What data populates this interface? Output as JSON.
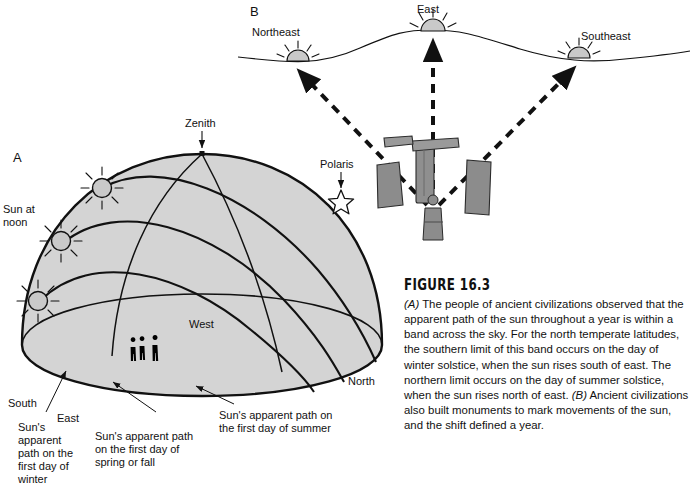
{
  "figure": {
    "number_label": "FIGURE 16.3",
    "caption_parts": {
      "a_marker": "(A)",
      "a_text": " The people of ancient civilizations observed that the apparent path of the sun throughout a year is within a band across the sky. For the north temperate latitudes, the southern limit of this band occurs on the day of winter solstice, when the sun rises south of east. The northern limit occurs on the day of summer solstice, when the sun rises north of east. ",
      "b_marker": "(B)",
      "b_text": " Ancient civilizations also built monuments to mark movements of the sun, and the shift defined a year."
    },
    "caption_full": "(A) The people of ancient civilizations observed that the apparent path of the sun throughout a year is within a band across the sky. For the north temperate latitudes, the southern limit of this band occurs on the day of winter solstice, when the sun rises south of east. The northern limit occurs on the day of summer solstice, when the sun rises north of east. (B) Ancient civilizations also built monuments to mark movements of the sun, and the shift defined a year."
  },
  "panel_a": {
    "letter": "A",
    "labels": {
      "zenith": "Zenith",
      "polaris": "Polaris",
      "sun_at_noon": "Sun at\nnoon",
      "west": "West",
      "south": "South",
      "east": "East",
      "north": "North",
      "path_winter": "Sun's\napparent\npath on the\nfirst day of\nwinter",
      "path_spring_fall": "Sun's apparent path\non the first day of\nspring or fall",
      "path_summer": "Sun's apparent path on\nthe first day of summer"
    },
    "icons": {
      "zenith_marker": "zenith-dot-icon",
      "polaris_star": "star-icon",
      "suns": "sun-burst-icon",
      "observers": "people-silhouette-icon"
    },
    "sun_count": 3,
    "observer_count": 3,
    "arc_count": 3
  },
  "panel_b": {
    "letter": "B",
    "labels": {
      "northeast": "Northeast",
      "east": "East",
      "southeast": "Southeast"
    },
    "icons": {
      "suns": "rising-sun-icon",
      "sightlines": "dashed-arrow-icon",
      "trilithon": "trilithon-stone-icon",
      "standing_stone": "standing-stone-icon",
      "observer": "person-icon"
    },
    "sun_count": 3,
    "stone_count": 3
  },
  "colors": {
    "dome_fill": "#d4d4d4",
    "stone_fill": "#8c8c8c",
    "stone_fill_light": "#9a9a9a",
    "sun_fill": "#c9c9c9",
    "line": "#111111",
    "text": "#111111",
    "background": "#ffffff"
  }
}
